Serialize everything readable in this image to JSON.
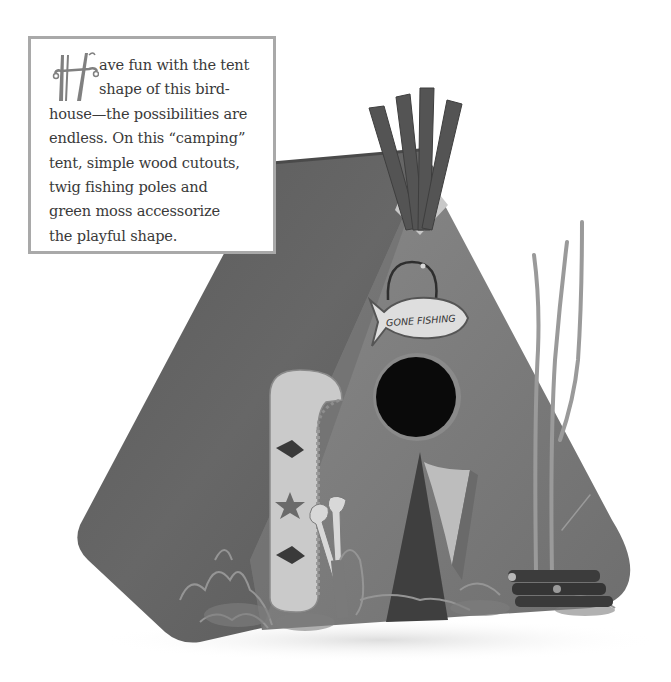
{
  "caption": {
    "drop_cap": "H",
    "lines": [
      "ave fun with the tent",
      "shape of this bird-",
      "house—the possibilities are",
      "endless. On this “camping”",
      "tent, simple wood cutouts,",
      "twig fishing poles and",
      "green moss accessorize",
      "the playful shape."
    ],
    "lead_word": "ave"
  },
  "photo": {
    "subject": "tent-shaped birdhouse",
    "sign_text": "GONE FISHING",
    "colors": {
      "roof": "#5e5e5e",
      "front": "#7a7a7a",
      "canoe": "#c9c9c9",
      "hole": "#0a0a0a",
      "door": "#3f3f3f",
      "door_flap": "#b8b8b8",
      "poles": "#555555",
      "twigs": "#9a9a9a",
      "logs": "#3a3a3a",
      "moss": "#8c8c8c",
      "sign": "#e2e2e2",
      "box_border": "#a9a9a9",
      "text": "#3a3a3a"
    }
  }
}
